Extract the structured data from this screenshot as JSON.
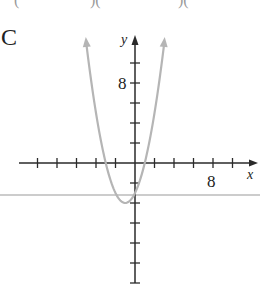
{
  "top_fragments": [
    "(",
    ")(",
    ")("
  ],
  "option_label": "C",
  "chart_data": {
    "type": "line",
    "title": "",
    "function": "y = x^2 + 2x - 3",
    "xlabel": "x",
    "ylabel": "y",
    "x_tick_step": 2,
    "y_tick_step": 2,
    "x_tick_labels": [
      {
        "value": 8,
        "label": "8"
      }
    ],
    "y_tick_labels": [
      {
        "value": 8,
        "label": "8"
      }
    ],
    "xlim": [
      -10,
      12
    ],
    "ylim": [
      -12,
      12
    ],
    "vertex": [
      -1,
      -4
    ],
    "x_intercepts": [
      -3,
      1
    ],
    "y_intercept": -3,
    "series": [
      {
        "name": "parabola",
        "color": "#b5b5b5",
        "x": [
          -5,
          -4,
          -3,
          -2,
          -1,
          0,
          1,
          2,
          3
        ],
        "y": [
          12,
          5,
          0,
          -3,
          -4,
          -3,
          0,
          5,
          12
        ]
      }
    ],
    "grid": false,
    "legend": "none"
  },
  "colors": {
    "axis": "#2a2a2a",
    "curve": "#b5b5b5",
    "rule": "#9a9a9a"
  }
}
